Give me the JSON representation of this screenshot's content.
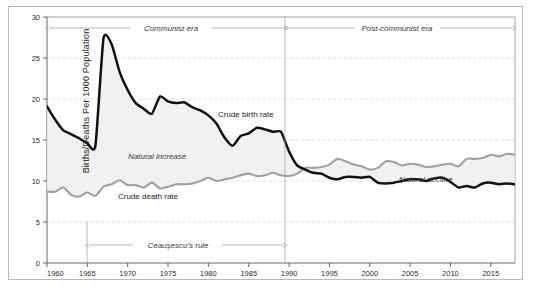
{
  "figure": {
    "ylabel": "Births/Deaths Per 1000 Population",
    "series_labels": {
      "birth": "Crude birth rate",
      "death": "Crude death rate"
    },
    "region_labels": {
      "natural_increase": "Natural increase",
      "natural_decline": "Natural decline"
    },
    "era_labels": {
      "communist": "Communist era",
      "post_communist": "Post-communist era",
      "ceausescu": "Ceaușescu's rule"
    }
  },
  "chart_data": {
    "type": "line",
    "title": "",
    "xlabel": "",
    "ylabel": "Births/Deaths Per 1000 Population",
    "xlim": [
      1960,
      2018
    ],
    "ylim": [
      0,
      30
    ],
    "yticks": [
      0,
      5,
      10,
      15,
      20,
      25,
      30
    ],
    "xticks": [
      1960,
      1965,
      1970,
      1975,
      1980,
      1985,
      1990,
      1995,
      2000,
      2005,
      2010,
      2015
    ],
    "grid": true,
    "legend": "inline-annotations",
    "x": [
      1960,
      1961,
      1962,
      1963,
      1964,
      1965,
      1966,
      1967,
      1968,
      1969,
      1970,
      1971,
      1972,
      1973,
      1974,
      1975,
      1976,
      1977,
      1978,
      1979,
      1980,
      1981,
      1982,
      1983,
      1984,
      1985,
      1986,
      1987,
      1988,
      1989,
      1990,
      1991,
      1992,
      1993,
      1994,
      1995,
      1996,
      1997,
      1998,
      1999,
      2000,
      2001,
      2002,
      2003,
      2004,
      2005,
      2006,
      2007,
      2008,
      2009,
      2010,
      2011,
      2012,
      2013,
      2014,
      2015,
      2016,
      2017,
      2018
    ],
    "series": [
      {
        "name": "Crude birth rate",
        "color": "#111111",
        "values": [
          19.1,
          17.5,
          16.2,
          15.7,
          15.2,
          14.6,
          14.3,
          27.4,
          26.7,
          23.3,
          21.1,
          19.5,
          18.8,
          18.2,
          20.3,
          19.7,
          19.5,
          19.6,
          19.0,
          18.6,
          18.0,
          17.0,
          15.3,
          14.3,
          15.5,
          15.8,
          16.5,
          16.3,
          16.0,
          16.0,
          13.6,
          11.9,
          11.4,
          11.0,
          10.9,
          10.4,
          10.2,
          10.5,
          10.5,
          10.4,
          10.5,
          9.8,
          9.7,
          9.8,
          10.0,
          10.2,
          10.2,
          10.0,
          10.3,
          10.4,
          9.9,
          9.2,
          9.4,
          9.2,
          9.7,
          9.8,
          9.6,
          9.7,
          9.6
        ]
      },
      {
        "name": "Crude death rate",
        "color": "#a0a0a0",
        "values": [
          8.7,
          8.7,
          9.2,
          8.3,
          8.1,
          8.6,
          8.2,
          9.3,
          9.6,
          10.1,
          9.5,
          9.5,
          9.2,
          9.8,
          9.1,
          9.3,
          9.6,
          9.6,
          9.7,
          10.0,
          10.4,
          10.0,
          10.2,
          10.4,
          10.7,
          10.9,
          10.6,
          10.7,
          11.0,
          10.7,
          10.6,
          10.9,
          11.6,
          11.6,
          11.7,
          12.0,
          12.7,
          12.4,
          12.0,
          11.8,
          11.4,
          11.6,
          12.4,
          12.3,
          11.9,
          12.1,
          12.0,
          11.7,
          11.8,
          12.0,
          12.1,
          11.8,
          12.7,
          12.7,
          12.8,
          13.2,
          13.0,
          13.3,
          13.2
        ]
      }
    ],
    "annotations": [
      {
        "text": "Communist era",
        "type": "era-span",
        "x_start": 1960,
        "x_end": 1989,
        "y": 28.6
      },
      {
        "text": "Post-communist era",
        "type": "era-span",
        "x_start": 1990,
        "x_end": 2018,
        "y": 28.6
      },
      {
        "text": "Ceaușescu's rule",
        "type": "era-span",
        "x_start": 1965,
        "x_end": 1989,
        "y": 2.2
      },
      {
        "text": "Crude birth rate",
        "type": "series-label",
        "x": 1979,
        "y": 17.8
      },
      {
        "text": "Crude death rate",
        "type": "series-label",
        "x": 1973,
        "y": 7.6
      },
      {
        "text": "Natural increase",
        "type": "region-label",
        "x": 1972,
        "y": 12.7
      },
      {
        "text": "Natural decline",
        "type": "region-label",
        "x": 2006,
        "y": 10.4
      }
    ],
    "vertical_markers": [
      1965,
      1989.5
    ]
  }
}
